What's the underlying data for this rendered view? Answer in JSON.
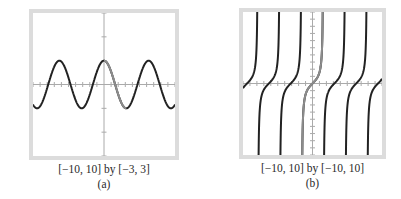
{
  "chart_data": [
    {
      "type": "line",
      "panel": "a",
      "function": "y = cos(x)",
      "window_label": "[−10, 10] by [−3, 3]",
      "caption": "(a)",
      "xlim": [
        -10,
        10
      ],
      "ylim": [
        -3,
        3
      ],
      "x_tick_step": 1,
      "y_tick_step": 1,
      "grid": false,
      "series": [
        {
          "name": "cos x (full)",
          "x_range": [
            -10,
            10
          ],
          "color": "#222222"
        },
        {
          "name": "cos x (highlighted, 0 to π)",
          "x_range": [
            0,
            3.14159
          ],
          "color": "#8c8c8c"
        }
      ],
      "annotations": [
        "peaks at x = −2π, 0, 2π with y = 1",
        "troughs at y = −1"
      ]
    },
    {
      "type": "line",
      "panel": "b",
      "function": "y = tan(x)",
      "window_label": "[−10, 10] by [−10, 10]",
      "caption": "(b)",
      "xlim": [
        -10,
        10
      ],
      "ylim": [
        -10,
        10
      ],
      "x_tick_step": 1,
      "y_tick_step": 1,
      "grid": false,
      "series": [
        {
          "name": "tan x (all branches)",
          "x_range": [
            -10,
            10
          ],
          "color": "#222222"
        },
        {
          "name": "tan x (highlighted, −π/2 to π/2)",
          "x_range": [
            -1.5708,
            1.5708
          ],
          "color": "#8c8c8c"
        }
      ],
      "annotations": [
        "vertical asymptotes at x = ±π/2, ±3π/2, ±5π/2"
      ]
    }
  ],
  "panels": {
    "a": {
      "window_label": "[−10, 10] by [−3, 3]",
      "caption": "(a)"
    },
    "b": {
      "window_label": "[−10, 10] by [−10, 10]",
      "caption": "(b)"
    }
  },
  "colors": {
    "frame": "#dcdcdc",
    "axis": "#aaaaaa",
    "curve": "#222222",
    "highlight": "#8c8c8c"
  }
}
